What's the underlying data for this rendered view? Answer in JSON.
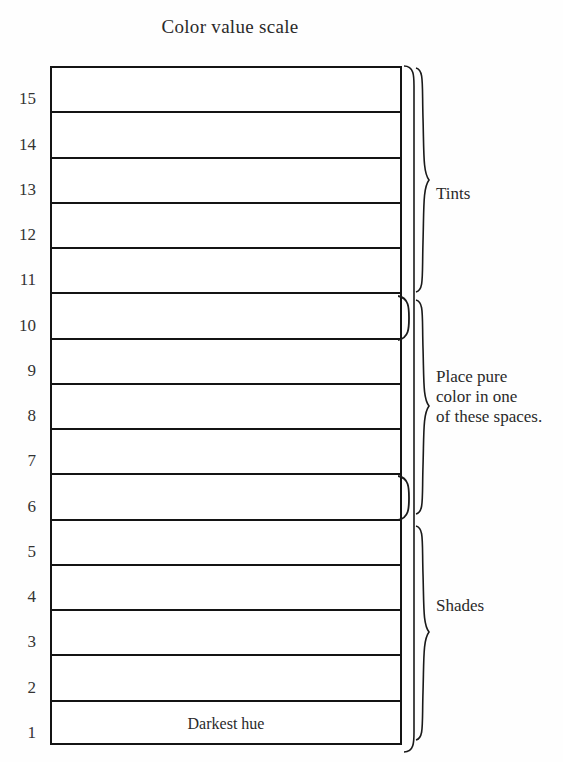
{
  "page": {
    "title": "Color value scale",
    "background_color": "#fefefe",
    "ink_color": "#141414"
  },
  "scale": {
    "total_steps": 15,
    "top_step": 15,
    "bottom_step": 1,
    "rows": [
      {
        "number": "15",
        "note": ""
      },
      {
        "number": "14",
        "note": ""
      },
      {
        "number": "13",
        "note": ""
      },
      {
        "number": "12",
        "note": ""
      },
      {
        "number": "11",
        "note": ""
      },
      {
        "number": "10",
        "note": ""
      },
      {
        "number": "9",
        "note": ""
      },
      {
        "number": "8",
        "note": ""
      },
      {
        "number": "7",
        "note": ""
      },
      {
        "number": "6",
        "note": ""
      },
      {
        "number": "5",
        "note": ""
      },
      {
        "number": "4",
        "note": ""
      },
      {
        "number": "3",
        "note": ""
      },
      {
        "number": "2",
        "note": ""
      },
      {
        "number": "1",
        "note": "Darkest hue"
      }
    ]
  },
  "annotations": {
    "tints": {
      "label": "Tints"
    },
    "place_pure_color": {
      "line1": "Place pure",
      "line2": "color in one",
      "line3": "of these spaces."
    },
    "shades": {
      "label": "Shades"
    }
  },
  "chart_data": {
    "type": "table",
    "title": "Color value scale",
    "orientation": "vertical",
    "categories": [
      "15",
      "14",
      "13",
      "12",
      "11",
      "10",
      "9",
      "8",
      "7",
      "6",
      "5",
      "4",
      "3",
      "2",
      "1"
    ],
    "values": [
      15,
      14,
      13,
      12,
      11,
      10,
      9,
      8,
      7,
      6,
      5,
      4,
      3,
      2,
      1
    ],
    "xlabel": "",
    "ylabel": "",
    "ylim": [
      1,
      15
    ],
    "grid": true,
    "legend": "right",
    "cell_labels": {
      "1": "Darkest hue"
    },
    "annotations": [
      {
        "text": "Tints",
        "span_steps": [
          15,
          11
        ],
        "side": "right"
      },
      {
        "text": "Place pure color in one of these spaces.",
        "span_steps": [
          10,
          6
        ],
        "side": "right"
      },
      {
        "text": "Shades",
        "span_steps": [
          5,
          1
        ],
        "side": "right"
      }
    ],
    "highlight_brackets": [
      {
        "step": 10,
        "side": "right"
      },
      {
        "step": 6,
        "side": "right"
      }
    ]
  }
}
